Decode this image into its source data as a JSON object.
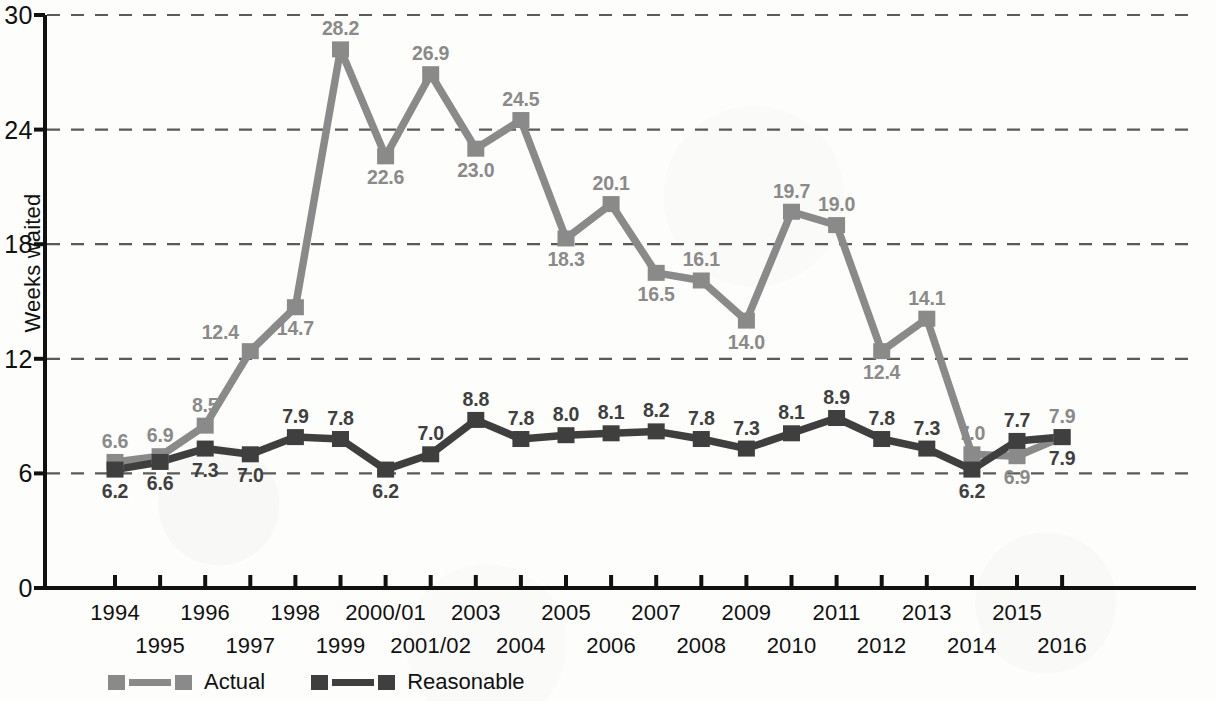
{
  "chart_data": {
    "type": "line",
    "title": "",
    "xlabel": "",
    "ylabel": "Weeks waited",
    "ylim": [
      0,
      30
    ],
    "yticks": [
      0,
      6,
      12,
      18,
      24,
      30
    ],
    "ytick_labels": [
      "0",
      "6",
      "12",
      "18",
      "24",
      "30"
    ],
    "grid": "horizontal-dashed",
    "legend_position": "bottom-left",
    "categories": [
      "1994",
      "1995",
      "1996",
      "1997",
      "1998",
      "1999",
      "2000/01",
      "2001/02",
      "2003",
      "2004",
      "2005",
      "2006",
      "2007",
      "2008",
      "2009",
      "2010",
      "2011",
      "2012",
      "2013",
      "2014",
      "2015",
      "2016"
    ],
    "series": [
      {
        "name": "Actual",
        "color": "#8a8a8a",
        "values": [
          6.6,
          6.9,
          8.5,
          12.4,
          14.7,
          28.2,
          22.6,
          26.9,
          23.0,
          24.5,
          18.3,
          20.1,
          16.5,
          16.1,
          14.0,
          19.7,
          19.0,
          12.4,
          14.1,
          7.0,
          6.9,
          7.9
        ],
        "labels": [
          "6.6",
          "6.9",
          "8.5",
          "12.4",
          "14.7",
          "28.2",
          "22.6",
          "26.9",
          "23.0",
          "24.5",
          "18.3",
          "20.1",
          "16.5",
          "16.1",
          "14.0",
          "19.7",
          "19.0",
          "12.4",
          "14.1",
          "7.0",
          "6.9",
          "7.9"
        ],
        "label_positions": [
          "above",
          "above",
          "above",
          "left-above",
          "below",
          "above",
          "below",
          "above",
          "below",
          "above",
          "below",
          "above",
          "below",
          "above",
          "below",
          "above",
          "above",
          "below",
          "above",
          "above",
          "below",
          "above"
        ]
      },
      {
        "name": "Reasonable",
        "color": "#3f3f3f",
        "values": [
          6.2,
          6.6,
          7.3,
          7.0,
          7.9,
          7.8,
          6.2,
          7.0,
          8.8,
          7.8,
          8.0,
          8.1,
          8.2,
          7.8,
          7.3,
          8.1,
          8.9,
          7.8,
          7.3,
          6.2,
          7.7,
          7.9
        ],
        "labels": [
          "6.2",
          "6.6",
          "7.3",
          "7.0",
          "7.9",
          "7.8",
          "6.2",
          "7.0",
          "8.8",
          "7.8",
          "8.0",
          "8.1",
          "8.2",
          "7.8",
          "7.3",
          "8.1",
          "8.9",
          "7.8",
          "7.3",
          "6.2",
          "7.7",
          "7.9"
        ],
        "label_positions": [
          "below",
          "below",
          "below",
          "below",
          "above",
          "above",
          "below",
          "above",
          "above",
          "above",
          "above",
          "above",
          "above",
          "above",
          "above",
          "above",
          "above",
          "above",
          "above",
          "below",
          "above",
          "below"
        ]
      }
    ]
  },
  "legend": {
    "items": [
      {
        "label": "Actual",
        "color": "#8a8a8a"
      },
      {
        "label": "Reasonable",
        "color": "#3f3f3f"
      }
    ]
  }
}
